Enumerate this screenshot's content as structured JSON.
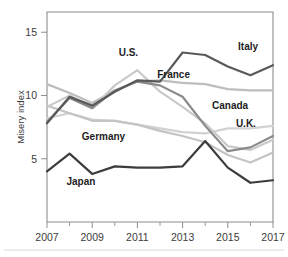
{
  "chart_data": {
    "type": "line",
    "title": "",
    "xlabel": "",
    "ylabel": "Misery index",
    "xlim": [
      2007,
      2017
    ],
    "ylim": [
      0,
      16.6
    ],
    "grid": false,
    "legend_position": "inline-labels",
    "x": [
      2007,
      2008,
      2009,
      2010,
      2011,
      2012,
      2013,
      2014,
      2015,
      2016,
      2017
    ],
    "xticks": [
      "2007",
      "2009",
      "2011",
      "2013",
      "2015",
      "2017"
    ],
    "xtick_values": [
      2007,
      2009,
      2011,
      2013,
      2015,
      2017
    ],
    "yticks": [
      "5",
      "10",
      "15"
    ],
    "ytick_values": [
      5,
      10,
      15
    ],
    "series": [
      {
        "name": "Italy",
        "color": "#595959",
        "label": "Italy",
        "values": [
          7.8,
          9.9,
          9.2,
          10.3,
          11.2,
          11.1,
          13.4,
          13.2,
          12.3,
          11.6,
          12.4
        ]
      },
      {
        "name": "France",
        "color": "#bdbdbd",
        "label": "France",
        "values": [
          10.9,
          10.2,
          9.4,
          10.4,
          11.1,
          11.2,
          11.0,
          10.9,
          10.5,
          10.4,
          10.4
        ]
      },
      {
        "name": "U.S.",
        "color": "#c9c9c9",
        "label": "U.S.",
        "values": [
          9.1,
          10.0,
          9.0,
          10.8,
          12.0,
          10.3,
          9.1,
          7.8,
          6.0,
          5.7,
          6.5
        ]
      },
      {
        "name": "Canada",
        "color": "#d2d2d2",
        "label": "Canada",
        "values": [
          8.2,
          8.6,
          8.1,
          8.0,
          7.7,
          7.4,
          7.1,
          7.0,
          7.4,
          7.4,
          7.6
        ]
      },
      {
        "name": "U.K.",
        "color": "#8a8a8a",
        "label": "U.K.",
        "values": [
          7.9,
          9.8,
          9.0,
          10.4,
          11.1,
          10.8,
          9.9,
          7.6,
          5.6,
          5.9,
          6.8
        ]
      },
      {
        "name": "Germany",
        "color": "#c4c4c4",
        "label": "Germany",
        "values": [
          9.2,
          8.6,
          8.0,
          8.0,
          7.7,
          7.2,
          6.8,
          6.3,
          5.3,
          4.7,
          5.5
        ]
      },
      {
        "name": "Japan",
        "color": "#3c3c3c",
        "label": "Japan",
        "values": [
          4.0,
          5.4,
          3.8,
          4.4,
          4.3,
          4.3,
          4.4,
          6.4,
          4.3,
          3.1,
          3.3
        ]
      }
    ],
    "annotations": [
      {
        "text": "U.S.",
        "x": 2010.6,
        "y": 13.1
      },
      {
        "text": "France",
        "x": 2012.6,
        "y": 11.4
      },
      {
        "text": "Italy",
        "x": 2015.9,
        "y": 13.6
      },
      {
        "text": "Canada",
        "x": 2015.1,
        "y": 8.9
      },
      {
        "text": "U.K.",
        "x": 2015.8,
        "y": 7.5
      },
      {
        "text": "Germany",
        "x": 2009.5,
        "y": 6.5
      },
      {
        "text": "Japan",
        "x": 2008.5,
        "y": 2.9
      }
    ]
  }
}
